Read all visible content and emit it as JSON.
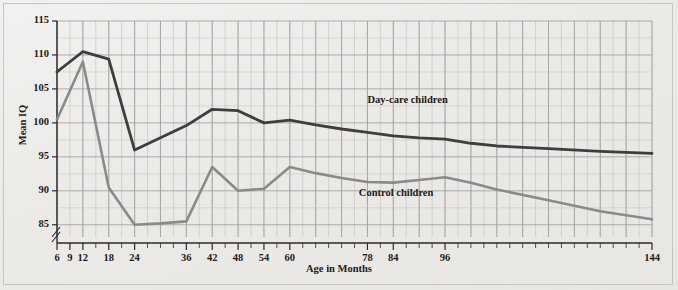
{
  "chart_data": {
    "type": "line",
    "title": "",
    "xlabel": "Age in Months",
    "ylabel": "Mean IQ",
    "xlim": [
      6,
      144
    ],
    "ylim": [
      83.2,
      115
    ],
    "y_axis_break": true,
    "grid": true,
    "y_ticks": [
      115,
      110,
      105,
      100,
      95,
      90,
      85
    ],
    "x_ticks": [
      6,
      9,
      12,
      18,
      24,
      36,
      42,
      48,
      54,
      60,
      78,
      84,
      96,
      144
    ],
    "x_minor_step": 3,
    "legend_position": "inline-annotations",
    "series": [
      {
        "name": "Day-care children",
        "color": "#3e3e40",
        "label_x": 78,
        "label_y": 103.0,
        "x": [
          6,
          9,
          12,
          18,
          24,
          30,
          36,
          42,
          48,
          54,
          60,
          66,
          72,
          78,
          84,
          90,
          96,
          102,
          108,
          120,
          132,
          144
        ],
        "values": [
          107.5,
          109.0,
          110.5,
          109.4,
          96.0,
          97.8,
          99.6,
          102.0,
          101.8,
          100.0,
          100.4,
          99.7,
          99.1,
          98.6,
          98.1,
          97.8,
          97.6,
          97.0,
          96.6,
          96.2,
          95.8,
          95.5
        ]
      },
      {
        "name": "Control children",
        "color": "#8a8a8c",
        "label_x": 76,
        "label_y": 89.2,
        "x": [
          6,
          12,
          18,
          24,
          30,
          36,
          42,
          48,
          54,
          60,
          66,
          72,
          78,
          84,
          90,
          96,
          102,
          108,
          120,
          132,
          144
        ],
        "values": [
          100.5,
          109.0,
          90.5,
          85.0,
          85.2,
          85.5,
          93.5,
          90.0,
          90.3,
          93.5,
          92.6,
          91.9,
          91.3,
          91.2,
          91.6,
          92.0,
          91.2,
          90.2,
          88.6,
          87.0,
          85.8
        ]
      }
    ]
  },
  "labels": {
    "y_axis_title": "Mean IQ",
    "x_axis_title": "Age in Months",
    "series_daycare": "Day-care children",
    "series_control": "Control children",
    "y_115": "115",
    "y_110": "110",
    "y_105": "105",
    "y_100": "100",
    "y_95": "95",
    "y_90": "90",
    "y_85": "85",
    "x_6": "6",
    "x_9": "9",
    "x_12": "12",
    "x_18": "18",
    "x_24": "24",
    "x_36": "36",
    "x_42": "42",
    "x_48": "48",
    "x_54": "54",
    "x_60": "60",
    "x_78": "78",
    "x_84": "84",
    "x_96": "96",
    "x_144": "144"
  },
  "colors": {
    "background": "#efeeec",
    "axis": "#2a2a2a",
    "grid_major": "#9a9a9c",
    "grid_minor": "#c6c5c3",
    "daycare_line": "#3e3e40",
    "control_line": "#8a8a8c"
  }
}
